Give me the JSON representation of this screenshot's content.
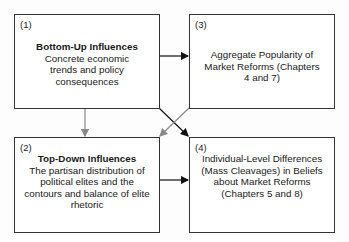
{
  "diagram": {
    "boxes": [
      {
        "id": "1",
        "label": "(1)",
        "title": "Bottom-Up Influences",
        "description": "Concrete economic trends and policy consequences"
      },
      {
        "id": "2",
        "label": "(2)",
        "title": "Top-Down Influences",
        "description": "The partisan distribution of political elites and the contours and balance of elite rhetoric"
      },
      {
        "id": "3",
        "label": "(3)",
        "title": "",
        "description": "Aggregate Popularity of Market Reforms (Chapters 4 and 7)"
      },
      {
        "id": "4",
        "label": "(4)",
        "title": "",
        "description": "Individual-Level Differences (Mass Cleavages) in Beliefs about Market Reforms (Chapters 5 and 8)"
      }
    ],
    "edges": [
      {
        "from": "1",
        "to": "3",
        "color": "#111111"
      },
      {
        "from": "1",
        "to": "2",
        "color": "#888888"
      },
      {
        "from": "1",
        "to": "4",
        "color": "#111111"
      },
      {
        "from": "3",
        "to": "2",
        "color": "#888888"
      },
      {
        "from": "2",
        "to": "4",
        "color": "#111111"
      }
    ]
  }
}
